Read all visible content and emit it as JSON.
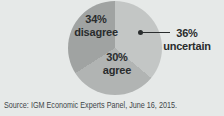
{
  "chart_data": {
    "type": "pie",
    "title": "",
    "slices": [
      {
        "name": "uncertain",
        "value": 36,
        "pct_label": "36%",
        "text_label": "uncertain",
        "color": "#c3c6c5"
      },
      {
        "name": "agree",
        "value": 30,
        "pct_label": "30%",
        "text_label": "agree",
        "color": "#b1b4b3"
      },
      {
        "name": "disagree",
        "value": 34,
        "pct_label": "34%",
        "text_label": "disagree",
        "color": "#a0a3a2"
      }
    ],
    "start_angle_deg": 0,
    "direction": "clockwise",
    "legend": "none",
    "annotations": [
      {
        "target": "uncertain",
        "style": "dot-line-callout"
      }
    ]
  },
  "source_line": "Source: IGM Economic Experts Panel, June 16, 2015.",
  "colors": {
    "background": "#e6e9e8",
    "label_text": "#292c2d",
    "annotation": "#2a2d2e",
    "source_text": "#414648"
  }
}
